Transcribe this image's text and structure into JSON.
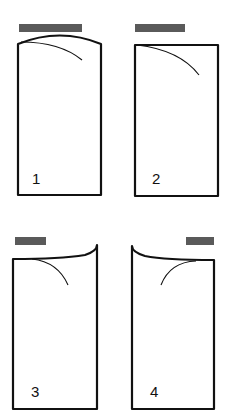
{
  "diagram": {
    "colors": {
      "outline": "#111111",
      "bar": "#5a5a5a",
      "background": "#ffffff"
    },
    "panels": [
      {
        "id": 1,
        "label": "1",
        "top_edge": "convex-arc",
        "bar_position": "full-width-center"
      },
      {
        "id": 2,
        "label": "2",
        "top_edge": "straight",
        "bar_position": "full-width-center"
      },
      {
        "id": 3,
        "label": "3",
        "top_edge": "curl-up-right",
        "bar_position": "left"
      },
      {
        "id": 4,
        "label": "4",
        "top_edge": "curl-up-left",
        "bar_position": "right"
      }
    ]
  }
}
